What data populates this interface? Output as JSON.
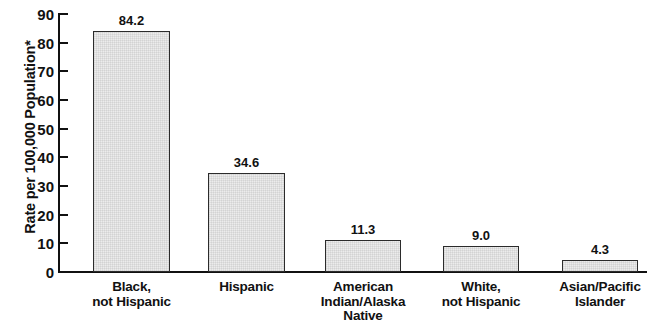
{
  "chart_data": {
    "type": "bar",
    "title": "",
    "subtitle": "",
    "xlabel": "",
    "ylabel": "Rate per 100,000 Population*",
    "ylim": [
      0,
      90
    ],
    "yticks": [
      "0",
      "10",
      "20",
      "30",
      "40",
      "50",
      "60",
      "70",
      "80",
      "90"
    ],
    "ytick_values": [
      0,
      10,
      20,
      30,
      40,
      50,
      60,
      70,
      80,
      90
    ],
    "grid": false,
    "legend": "none",
    "categories": [
      "Black, not Hispanic",
      "Hispanic",
      "American Indian/Alaska Native",
      "White, not Hispanic",
      "Asian/Pacific Islander"
    ],
    "category_lines": [
      [
        "Black,",
        "not Hispanic"
      ],
      [
        "Hispanic"
      ],
      [
        "American",
        "Indian/Alaska",
        "Native"
      ],
      [
        "White,",
        "not Hispanic"
      ],
      [
        "Asian/Pacific",
        "Islander"
      ]
    ],
    "values": [
      84.2,
      34.6,
      11.3,
      9.0,
      4.3
    ],
    "value_labels": [
      "84.2",
      "34.6",
      "11.3",
      "9.0",
      "4.3"
    ],
    "bar_fill_color": "#ececec",
    "bar_edge_color": "#2b2b2b",
    "text_color": "#111111",
    "background_color": "#ffffff"
  },
  "footnote_marker": "*"
}
